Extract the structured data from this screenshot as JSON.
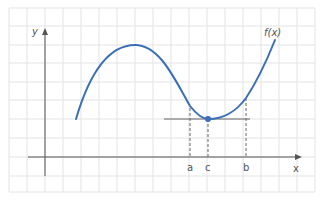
{
  "diagram": {
    "function_label": "f(x)",
    "axes": {
      "x_label": "x",
      "y_label": "y"
    },
    "points": [
      {
        "label": "a"
      },
      {
        "label": "c"
      },
      {
        "label": "b"
      }
    ],
    "colors": {
      "curve": "#3a6fb8",
      "grid": "#e3e3e3",
      "axis": "#555555",
      "dashed": "#666666",
      "tangent": "#666666"
    }
  }
}
